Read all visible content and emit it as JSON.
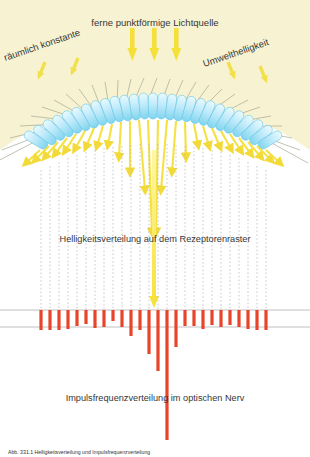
{
  "figure": {
    "title_source": "ferne punktförmige Lichtquelle",
    "label_left": "räumlich konstante",
    "label_right": "Umwelthelligkeit",
    "label_receptor": "Helligkeitsverteilung auf dem Rezeptorenraster",
    "label_nerve": "Impulsfrequenzverteilung im optischen Nerv",
    "caption": "Abb. 331.1   Helligkeitsverteilung und Impulsfrequenzverteilung",
    "colors": {
      "background": "#ffffff",
      "sky": "#f7f3d2",
      "arrow_yellow": "#f5e03a",
      "receptor_blue": "#9fe0f5",
      "receptor_fill": "#d9f3fb",
      "ray_gray": "#9a9a86",
      "bar_red": "#e8442a",
      "baseline_gray": "#b9b9b9",
      "text": "#363636"
    }
  },
  "chart_data": {
    "type": "bar",
    "title": "Impulsfrequenzverteilung im optischen Nerv",
    "xlabel": "",
    "ylabel": "Impulsfrequenz",
    "grid": false,
    "legend": "none",
    "baseline_top_y": 310,
    "baseline_bottom_y": 327,
    "bar_start_x": 41,
    "bar_spacing": 9.0,
    "bar_width": 3.2,
    "bar_top_y": 310,
    "note": "values are bar lengths in px downward from the upper reference line; large values form the central dip (lateral inhibition / Mach band)",
    "categories": [
      "r1",
      "r2",
      "r3",
      "r4",
      "r5",
      "r6",
      "r7",
      "r8",
      "r9",
      "r10",
      "r11",
      "r12",
      "r13",
      "r14",
      "r15",
      "r16",
      "r17",
      "r18",
      "r19",
      "r20",
      "r21",
      "r22",
      "r23",
      "r24",
      "r25",
      "r26"
    ],
    "values": [
      20,
      20,
      20,
      19,
      16,
      14,
      18,
      17,
      11,
      17,
      26,
      20,
      44,
      61,
      130,
      37,
      16,
      16,
      19,
      15,
      17,
      15,
      17,
      19,
      20,
      20
    ],
    "ylim": [
      0,
      140
    ]
  },
  "receptors": {
    "count": 27,
    "description": "arched row of photoreceptor capsules"
  },
  "rays": {
    "count": 27,
    "description": "ambient light rays converging onto the receptor arch"
  },
  "source_arrows": {
    "count": 3,
    "description": "thick vertical arrows from the distant point light source"
  },
  "ambient_arrows": {
    "count": 4,
    "description": "small tilted arrows marking spatially constant ambient brightness"
  },
  "fibers": {
    "count": 27,
    "description": "dotted vertical nerve fibres below the receptors"
  }
}
